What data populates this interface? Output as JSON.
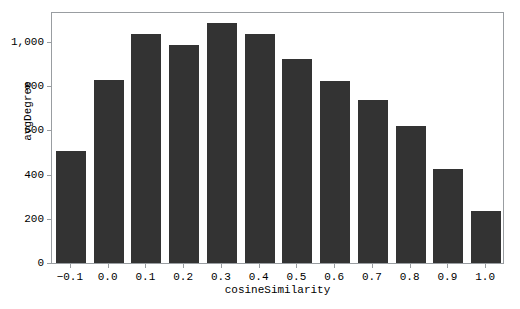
{
  "chart_data": {
    "type": "bar",
    "title": "",
    "subtitle": "",
    "xlabel": "cosineSimilarity",
    "ylabel": "avgDegree",
    "categories": [
      "-0.1",
      "0.0",
      "0.1",
      "0.2",
      "0.3",
      "0.4",
      "0.5",
      "0.6",
      "0.7",
      "0.8",
      "0.9",
      "1.0"
    ],
    "values": [
      507,
      828,
      1036,
      987,
      1086,
      1036,
      923,
      824,
      738,
      620,
      425,
      235
    ],
    "series": [
      {
        "name": "avgDegree",
        "values": [
          507,
          828,
          1036,
          987,
          1086,
          1036,
          923,
          824,
          738,
          620,
          425,
          235
        ]
      }
    ],
    "ylim": [
      0,
      1140
    ],
    "xlim_categories": 12,
    "ytick_values": [
      0,
      200,
      400,
      600,
      800,
      1000
    ],
    "ytick_labels": [
      "0",
      "200",
      "400",
      "600",
      "800",
      "1,000"
    ],
    "xtick_labels": [
      "-0.1",
      "0.0",
      "0.1",
      "0.2",
      "0.3",
      "0.4",
      "0.5",
      "0.6",
      "0.7",
      "0.8",
      "0.9",
      "1.0"
    ],
    "grid": false,
    "legend": null,
    "legend_position": "none",
    "bar_color": "#333333",
    "frame_color": "#999da1",
    "background_color": "#ffffff",
    "text_color": "#000000",
    "annotations": []
  }
}
